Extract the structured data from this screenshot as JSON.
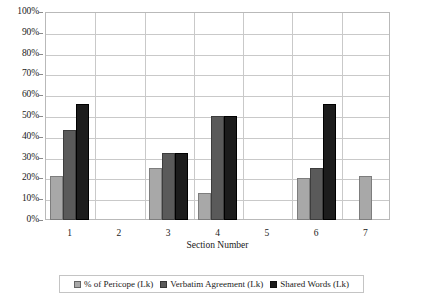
{
  "chart_data": {
    "type": "bar",
    "title": "",
    "subtitle": "",
    "xlabel": "Section Number",
    "ylabel": "",
    "categories": [
      "1",
      "2",
      "3",
      "4",
      "5",
      "6",
      "7"
    ],
    "series": [
      {
        "name": "% of Pericope (Lk)",
        "color": "#a8a8a8",
        "values": [
          21,
          0,
          25,
          13,
          0,
          20,
          21
        ]
      },
      {
        "name": "Verbatim Agreement (Lk)",
        "color": "#5a5a5a",
        "values": [
          43.5,
          0,
          32,
          50,
          0,
          25,
          0
        ]
      },
      {
        "name": "Shared Words (Lk)",
        "color": "#1c1c1c",
        "values": [
          56,
          0,
          32,
          50,
          0,
          56,
          0
        ]
      }
    ],
    "ylim": [
      0,
      100
    ],
    "ytick_values": [
      0,
      10,
      20,
      30,
      40,
      50,
      60,
      70,
      80,
      90,
      100
    ],
    "ytick_labels": [
      "0%",
      "10%",
      "20%",
      "30%",
      "40%",
      "50%",
      "60%",
      "70%",
      "80%",
      "90%",
      "100%"
    ],
    "grid": true,
    "grid_axis": "both",
    "legend_position": "bottom-center",
    "value_suffix": "%"
  },
  "axes": {
    "y_title": "",
    "x_title": "Section Number"
  },
  "legend": {
    "entries": [
      {
        "label": "% of Pericope (Lk)",
        "color": "#a8a8a8",
        "swatch": "legend-swatch-light"
      },
      {
        "label": "Verbatim Agreement (Lk)",
        "color": "#5a5a5a",
        "swatch": "legend-swatch-medium"
      },
      {
        "label": "Shared Words (Lk)",
        "color": "#1c1c1c",
        "swatch": "legend-swatch-dark"
      }
    ]
  },
  "colors": {
    "series_light": "#a8a8a8",
    "series_medium": "#5a5a5a",
    "series_dark": "#1c1c1c",
    "gridline": "#c9c9c9",
    "frame": "#b9b9b9",
    "background": "#ffffff",
    "text": "#1a1a1a"
  }
}
